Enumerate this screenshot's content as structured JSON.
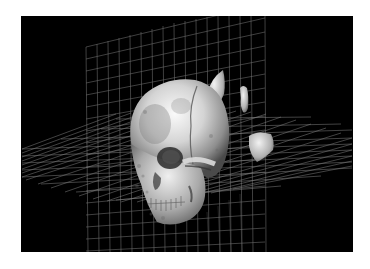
{
  "figure": {
    "background_color": "#000000",
    "grid_color": "#8a8a8a",
    "bone_color": "#e6e6e6",
    "objects": [
      {
        "name": "skull",
        "kind": "volume-render"
      },
      {
        "name": "bone-fragment-1",
        "kind": "volume-render"
      },
      {
        "name": "bone-fragment-2",
        "kind": "volume-render"
      },
      {
        "name": "bone-fragment-3",
        "kind": "volume-render"
      }
    ],
    "planes": [
      {
        "name": "vertical-plane",
        "orientation": "sagittal"
      },
      {
        "name": "horizontal-plane",
        "orientation": "axial"
      }
    ]
  }
}
